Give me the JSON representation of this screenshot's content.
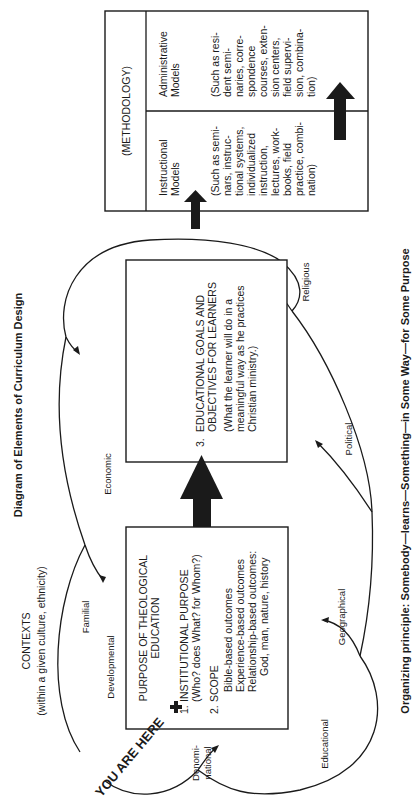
{
  "title": "Diagram of Elements of Curriculum Design",
  "footer": "Organizing principle: Somebody—learns—Something—in Some Way—for Some Purpose",
  "contexts": {
    "heading": "CONTEXTS",
    "subheading": "(within a given culture, ethnicity)",
    "labels": [
      "Familial",
      "Developmental",
      "Denomi-",
      "national",
      "Educational",
      "Geographical",
      "Political",
      "Religious",
      "Economic"
    ]
  },
  "you_are_here": "YOU ARE HERE",
  "box_purpose": {
    "heading_line1": "PURPOSE OF THEOLOGICAL",
    "heading_line2": "EDUCATION",
    "item1_num": "1.",
    "item1_title": "INSTITUTIONAL PURPOSE",
    "item1_sub": "(Who? does What? for Whom?)",
    "item2_num": "2.",
    "item2_title": "SCOPE",
    "scope_lines": [
      "Bible-based outcomes",
      "Experience-based outcomes",
      "Relationship-based outcomes:",
      "God, man, nature, history"
    ]
  },
  "box_goals": {
    "num": "3.",
    "title_line1": "EDUCATIONAL GOALS AND",
    "title_line2": "OBJECTIVES FOR LEARNERS",
    "desc_lines": [
      "(What the learner will do in a",
      "meaningful way as he practices",
      "Christian ministry.)"
    ]
  },
  "box_methodology": {
    "heading": "(METHODOLOGY)",
    "instructional": {
      "title_lines": [
        "Instructional",
        "Models"
      ],
      "desc_lines": [
        "(Such as semi-",
        "nars, instruc-",
        "tional systems,",
        "individualized",
        "instruction,",
        "lectures, work-",
        "books, field",
        "practice, combi-",
        "nation)"
      ]
    },
    "administrative": {
      "title_lines": [
        "Administrative",
        "Models"
      ],
      "desc_lines": [
        "(Such as resi-",
        "dent semi-",
        "naries, corre-",
        "spondence",
        "courses, exten-",
        "sion centers,",
        "field supervi-",
        "sion, combina-",
        "tion)"
      ]
    }
  },
  "colors": {
    "ink": "#1a1a1a",
    "paper": "#ffffff"
  }
}
